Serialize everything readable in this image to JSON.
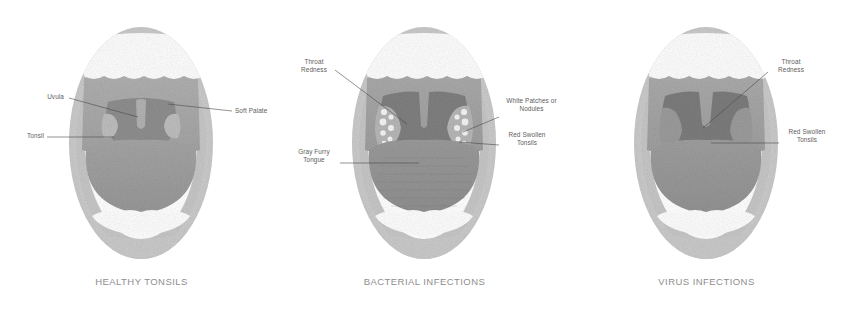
{
  "figure": {
    "type": "medical-illustration",
    "panel_count": 3,
    "palette": {
      "lip_outer": "#c9c9c9",
      "lip_inner": "#bdbdbd",
      "teeth": "#fdfdfd",
      "palate": "#a8a8a8",
      "tongue": "#9d9d9d",
      "throat_dark": "#8a8a8a",
      "throat_darker": "#7b7b7b",
      "tonsil": "#b4b4b4",
      "uvula": "#b0b0b0",
      "patch_white": "#f2f2f2",
      "label_text": "#5d5d5d",
      "caption_text": "#8e8e8e",
      "leader_line": "#4a4a4a",
      "background": "#ffffff"
    }
  },
  "panels": [
    {
      "id": "healthy-tonsils",
      "caption": "HEALTHY TONSILS",
      "labels": [
        {
          "name": "uvula",
          "text": "Uvula",
          "side": "left"
        },
        {
          "name": "tonsil",
          "text": "Tonsil",
          "side": "left"
        },
        {
          "name": "soft-palate",
          "text": "Soft Palate",
          "side": "right"
        }
      ]
    },
    {
      "id": "bacterial-infections",
      "caption": "BACTERIAL INFECTIONS",
      "labels": [
        {
          "name": "throat-redness",
          "text": "Throat\nRedness",
          "side": "left"
        },
        {
          "name": "gray-furry-tongue",
          "text": "Gray Furry\nTongue",
          "side": "left"
        },
        {
          "name": "white-patches-or-nodules",
          "text": "White Patches or\nNodules",
          "side": "right"
        },
        {
          "name": "red-swollen-tonsils",
          "text": "Red Swollen\nTonsils",
          "side": "right"
        }
      ]
    },
    {
      "id": "virus-infections",
      "caption": "VIRUS INFECTIONS",
      "labels": [
        {
          "name": "throat-redness",
          "text": "Throat\nRedness",
          "side": "right"
        },
        {
          "name": "red-swollen-tonsils",
          "text": "Red Swollen\nTonsils",
          "side": "right"
        }
      ]
    }
  ]
}
